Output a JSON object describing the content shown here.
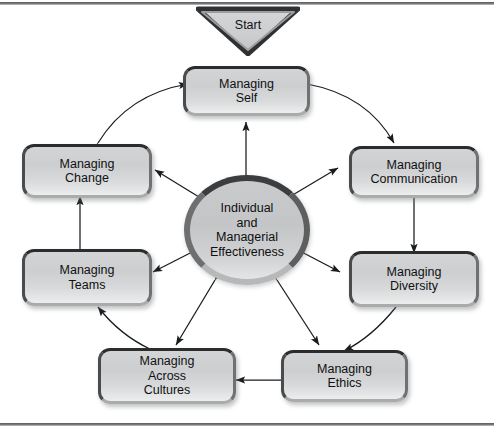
{
  "diagram": {
    "start": {
      "label": "Start",
      "shape": "downward-triangle"
    },
    "hub": {
      "label": "Individual\nand\nManagerial\nEffectiveness",
      "shape": "circle"
    },
    "nodes": [
      {
        "id": "managing-self",
        "label": "Managing\nSelf"
      },
      {
        "id": "managing-communication",
        "label": "Managing\nCommunication"
      },
      {
        "id": "managing-diversity",
        "label": "Managing\nDiversity"
      },
      {
        "id": "managing-ethics",
        "label": "Managing\nEthics"
      },
      {
        "id": "managing-across-cultures",
        "label": "Managing\nAcross\nCultures"
      },
      {
        "id": "managing-teams",
        "label": "Managing\nTeams"
      },
      {
        "id": "managing-change",
        "label": "Managing\nChange"
      }
    ],
    "colors": {
      "node_fill": "#d3d4d5",
      "node_border_dark": "#2b2c2e",
      "hub_fill": "#c9cacc",
      "hub_ring": "#3c3d3f",
      "connector": "#1a1b1c",
      "frame_rule": "#6e7073",
      "background": "#ffffff"
    }
  }
}
